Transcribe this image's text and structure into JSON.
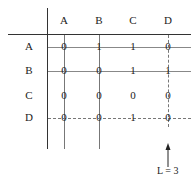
{
  "columns": [
    "A",
    "B",
    "C",
    "D"
  ],
  "rows": [
    {
      "label": "A",
      "cells": [
        "0",
        "1",
        "1",
        "0"
      ]
    },
    {
      "label": "B",
      "cells": [
        "0",
        "0",
        "1",
        "1"
      ]
    },
    {
      "label": "C",
      "cells": [
        "0",
        "0",
        "0",
        "0"
      ]
    },
    {
      "label": "D",
      "cells": [
        "0",
        "0",
        "1",
        "0"
      ]
    }
  ],
  "annotation": {
    "label": "L = 3",
    "column": "D"
  },
  "dashed": {
    "row": "D",
    "column": "D"
  }
}
